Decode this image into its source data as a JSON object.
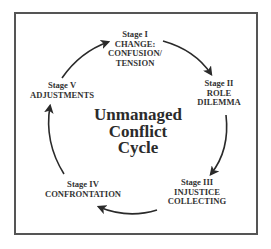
{
  "diagram": {
    "title_lines": [
      "Unmanaged",
      "Conflict",
      "Cycle"
    ],
    "type": "cycle",
    "stages": [
      {
        "id": "stage-1",
        "lines": [
          "Stage I",
          "CHANGE:",
          "CONFUSION/",
          "TENSION"
        ]
      },
      {
        "id": "stage-2",
        "lines": [
          "Stage II",
          "ROLE",
          "DILEMMA"
        ]
      },
      {
        "id": "stage-3",
        "lines": [
          "Stage III",
          "INJUSTICE",
          "COLLECTING"
        ]
      },
      {
        "id": "stage-4",
        "lines": [
          "Stage IV",
          "CONFRONTATION"
        ]
      },
      {
        "id": "stage-5",
        "lines": [
          "Stage V",
          "ADJUSTMENTS"
        ]
      }
    ],
    "edges": [
      {
        "from": "Stage I",
        "to": "Stage II"
      },
      {
        "from": "Stage II",
        "to": "Stage III"
      },
      {
        "from": "Stage III",
        "to": "Stage IV"
      },
      {
        "from": "Stage IV",
        "to": "Stage V"
      },
      {
        "from": "Stage V",
        "to": "Stage I"
      }
    ],
    "colors": {
      "border": "#555555",
      "text": "#333333",
      "arrow": "#2a2a2a",
      "background": "#ffffff"
    }
  }
}
